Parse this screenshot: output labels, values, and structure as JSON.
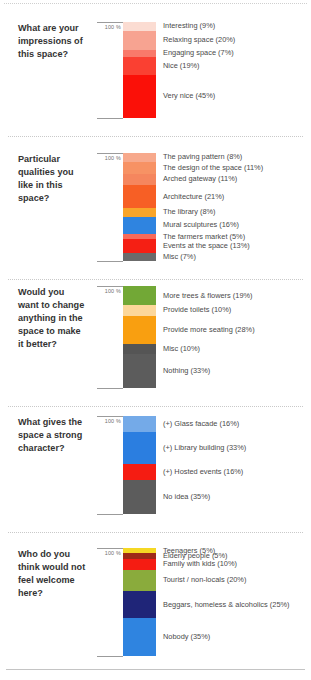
{
  "chart_data": [
    {
      "type": "bar",
      "title": "What are your impressions of this space?",
      "subtype": "stacked-100-percent",
      "axis_top_label": "100 %",
      "ylim": [
        0,
        100
      ],
      "grid": false,
      "legend": "right-inline",
      "categories": [
        "Interesting",
        "Relaxing space",
        "Engaging space",
        "Nice",
        "Very nice"
      ],
      "values": [
        9,
        20,
        7,
        19,
        45
      ],
      "colors": [
        "#fbdcd2",
        "#f7a391",
        "#f9796a",
        "#fa4032",
        "#fb1008"
      ],
      "labels": [
        "Interesting (9%)",
        "Relaxing space (20%)",
        "Engaging space (7%)",
        "Nice (19%)",
        "Very nice (45%)"
      ]
    },
    {
      "type": "bar",
      "title": "Particular qualities you like in this space?",
      "subtype": "stacked-100-percent",
      "axis_top_label": "100 %",
      "ylim": [
        0,
        100
      ],
      "grid": false,
      "legend": "right-inline",
      "categories": [
        "The paving pattern",
        "The design of the space",
        "Arched gateway",
        "Architecture",
        "The library",
        "Mural sculptures",
        "The farmers market",
        "Events at the space",
        "Misc"
      ],
      "values": [
        8,
        11,
        11,
        21,
        8,
        16,
        5,
        13,
        7
      ],
      "colors": [
        "#f7a98c",
        "#f79264",
        "#f5865e",
        "#f75f25",
        "#f9a52a",
        "#2f84e0",
        "#f76a5a",
        "#f51f14",
        "#6b6b6b"
      ],
      "labels": [
        "The paving pattern (8%)",
        "The design of the space (11%)",
        "Arched gateway (11%)",
        "Architecture (21%)",
        "The library (8%)",
        "Mural sculptures (16%)",
        "The farmers market (5%)",
        "Events at the space (13%)",
        "Misc (7%)"
      ]
    },
    {
      "type": "bar",
      "title": "Would you want to change anything in the space to make it better?",
      "subtype": "stacked-100-percent",
      "axis_top_label": "100 %",
      "ylim": [
        0,
        100
      ],
      "grid": false,
      "legend": "right-inline",
      "categories": [
        "More trees & flowers",
        "Provide toilets",
        "Provide more seating",
        "Misc",
        "Nothing"
      ],
      "values": [
        19,
        10,
        28,
        10,
        33
      ],
      "colors": [
        "#72a836",
        "#fcd79a",
        "#f99f10",
        "#555555",
        "#5c5c5c"
      ],
      "labels": [
        "More trees & flowers (19%)",
        "Provide toilets (10%)",
        "Provide more seating (28%)",
        "Misc (10%)",
        "Nothing (33%)"
      ]
    },
    {
      "type": "bar",
      "title": "What gives the space a strong character?",
      "subtype": "stacked-100-percent",
      "axis_top_label": "100 %",
      "ylim": [
        0,
        100
      ],
      "grid": false,
      "legend": "right-inline",
      "categories": [
        "(+) Glass facade",
        "(+) Library building",
        "(+) Hosted events",
        "No idea"
      ],
      "values": [
        16,
        33,
        16,
        35
      ],
      "colors": [
        "#74aae8",
        "#2b7ee0",
        "#f51c12",
        "#5c5c5c"
      ],
      "labels": [
        "(+) Glass facade (16%)",
        "(+) Library building (33%)",
        "(+) Hosted events (16%)",
        "No idea (35%)"
      ]
    },
    {
      "type": "bar",
      "title": "Who do you think would not feel welcome here?",
      "subtype": "stacked-100-percent",
      "axis_top_label": "100 %",
      "ylim": [
        0,
        100
      ],
      "grid": false,
      "legend": "right-inline",
      "categories": [
        "Teenagers",
        "Elderly people",
        "Family with kids",
        "Tourist / non-locals",
        "Beggars, homeless & alcoholics",
        "Nobody"
      ],
      "values": [
        5,
        5,
        10,
        20,
        25,
        35
      ],
      "colors": [
        "#f5d824",
        "#9e2a18",
        "#f51c12",
        "#8aab3c",
        "#1f2578",
        "#2f84e0"
      ],
      "labels": [
        "Teenagers (5%)",
        "Elderly people (5%)",
        "Family with kids (10%)",
        "Tourist / non-locals (20%)",
        "Beggars, homeless & alcoholics (25%)",
        "Nobody (35%)"
      ]
    }
  ],
  "layout": {
    "block_heights": [
      118,
      132,
      128,
      122,
      128
    ]
  }
}
